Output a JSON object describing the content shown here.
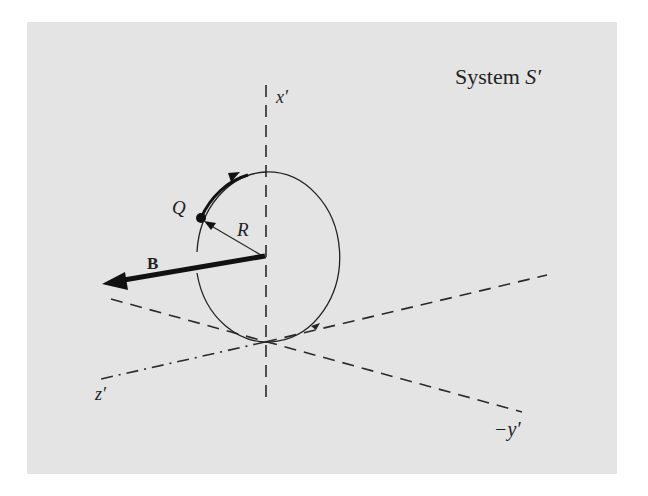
{
  "figure": {
    "title": "System S′",
    "title_main": "System ",
    "title_symbol": "S′",
    "labels": {
      "x_axis": "x′",
      "z_axis": "z′",
      "neg_y_axis": "−y′",
      "field": "B",
      "charge": "Q",
      "radius": "R"
    },
    "colors": {
      "background": "#e4e4e4",
      "ink": "#222222"
    }
  }
}
